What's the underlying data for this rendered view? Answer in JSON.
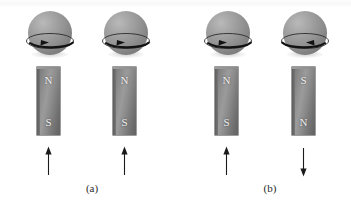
{
  "figure": {
    "background_color": "#ffffff",
    "sphere_color": "#8f8f8f",
    "magnet_color": "#8a8a8a",
    "stroke_color": "#1a1a1a",
    "pole_label_color": "#f2f2f2"
  },
  "panels": [
    {
      "id": "panel-a",
      "label": "(a)",
      "caption_left": 62,
      "units": [
        {
          "id": "unit-a1",
          "left": 4,
          "spin_direction": "left",
          "spin_arrow_glyph": "◀",
          "magnet_top_pole": "N",
          "magnet_bottom_pole": "S",
          "field_arrow_direction": "up",
          "field_arrow_glyph": "↑"
        },
        {
          "id": "unit-a2",
          "left": 80,
          "spin_direction": "left",
          "spin_arrow_glyph": "◀",
          "magnet_top_pole": "N",
          "magnet_bottom_pole": "S",
          "field_arrow_direction": "up",
          "field_arrow_glyph": "↑"
        }
      ]
    },
    {
      "id": "panel-b",
      "label": "(b)",
      "caption_left": 240,
      "units": [
        {
          "id": "unit-b1",
          "left": 182,
          "spin_direction": "left",
          "spin_arrow_glyph": "◀",
          "magnet_top_pole": "N",
          "magnet_bottom_pole": "S",
          "field_arrow_direction": "up",
          "field_arrow_glyph": "↑"
        },
        {
          "id": "unit-b2",
          "left": 259,
          "spin_direction": "right",
          "spin_arrow_glyph": "▶",
          "magnet_top_pole": "S",
          "magnet_bottom_pole": "N",
          "field_arrow_direction": "down",
          "field_arrow_glyph": "↓"
        }
      ]
    }
  ]
}
